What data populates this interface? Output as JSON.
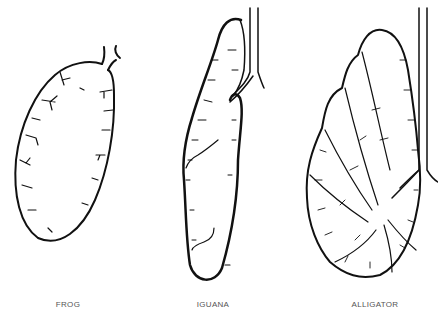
{
  "figure": {
    "panels": [
      {
        "id": "frog",
        "label": "FROG",
        "label_x": 68
      },
      {
        "id": "iguana",
        "label": "IGUANA",
        "label_x": 213
      },
      {
        "id": "alligator",
        "label": "ALLIGATOR",
        "label_x": 375
      }
    ]
  },
  "colors": {
    "ink": "#111111",
    "background": "#ffffff",
    "label": "#555555"
  }
}
